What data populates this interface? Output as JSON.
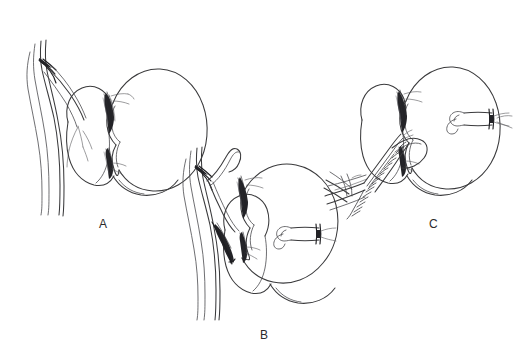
{
  "figure": {
    "background_color": "#ffffff",
    "ink_color": "#3a3a3c",
    "width": 531,
    "height": 353
  },
  "panels": [
    {
      "id": "a",
      "label": "A",
      "label_x": 99,
      "label_y": 218,
      "caption": "Kidney with intact great vessels and renal hilum exposed",
      "elements": [
        {
          "name": "great-vessels",
          "kind": "vessel-pair"
        },
        {
          "name": "vessel-bifurcation",
          "kind": "branch-point"
        },
        {
          "name": "medial-lobe",
          "kind": "organ-lobe"
        },
        {
          "name": "kidney-body",
          "kind": "kidney"
        },
        {
          "name": "renal-hilum-shading",
          "kind": "hatched-region"
        },
        {
          "name": "lower-pole",
          "kind": "organ-lobe"
        }
      ]
    },
    {
      "id": "b",
      "label": "B",
      "label_x": 260,
      "label_y": 329,
      "caption": "Kidney mobilized, vessels transected, ligated stump at lateral margin",
      "elements": [
        {
          "name": "great-vessels",
          "kind": "vessel-pair"
        },
        {
          "name": "vessel-bifurcation",
          "kind": "branch-point"
        },
        {
          "name": "transected-vessel-stump",
          "kind": "vessel-stump"
        },
        {
          "name": "kidney-body",
          "kind": "kidney"
        },
        {
          "name": "renal-hilum-shading",
          "kind": "hatched-region"
        },
        {
          "name": "ligature-band",
          "kind": "ligature"
        },
        {
          "name": "clamp-bands",
          "kind": "clamp"
        },
        {
          "name": "lower-pole",
          "kind": "organ-lobe"
        }
      ]
    },
    {
      "id": "c",
      "label": "C",
      "label_x": 429,
      "label_y": 218,
      "caption": "Completed running suture anastomosis between vessel and renal hilum",
      "elements": [
        {
          "name": "kidney-body",
          "kind": "kidney"
        },
        {
          "name": "medial-lobe",
          "kind": "organ-lobe"
        },
        {
          "name": "anastomosis-suture-line",
          "kind": "running-suture"
        },
        {
          "name": "renal-hilum-shading",
          "kind": "hatched-region"
        },
        {
          "name": "incoming-vessel-graft",
          "kind": "vessel-pair"
        },
        {
          "name": "ligated-vessel-stump",
          "kind": "vessel-stump"
        },
        {
          "name": "ligature-band",
          "kind": "ligature"
        }
      ]
    }
  ]
}
